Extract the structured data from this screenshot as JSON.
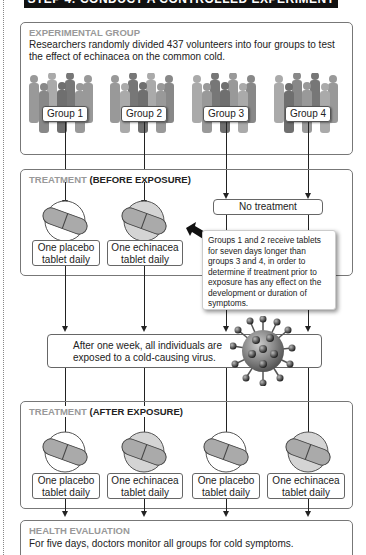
{
  "header": {
    "title": "STEP 4: CONDUCT A CONTROLLED EXPERIMENT"
  },
  "experimental_group": {
    "title": "EXPERIMENTAL GROUP",
    "text_line1": "Researchers randomly divided 437 volunteers into four groups to test",
    "text_line2": "the effect of echinacea on the common cold.",
    "groups": [
      "Group 1",
      "Group 2",
      "Group 3",
      "Group 4"
    ]
  },
  "treatment_before": {
    "title_light": "TREATMENT",
    "title_dark": "(BEFORE EXPOSURE)",
    "tablets": [
      {
        "line1": "One placebo",
        "line2": "tablet daily",
        "type": "placebo"
      },
      {
        "line1": "One echinacea",
        "line2": "tablet daily",
        "type": "echinacea"
      }
    ],
    "no_treatment": "No treatment",
    "note": "Groups 1 and 2 receive tablets for seven days longer than groups 3 and 4, in order to determine if treatment prior to exposure has any effect on the development or duration of symptoms."
  },
  "exposure": {
    "line1": "After one week, all individuals are",
    "line2": "exposed to a cold-causing virus.",
    "icon": "virus-icon"
  },
  "treatment_after": {
    "title_light": "TREATMENT",
    "title_dark": "(AFTER EXPOSURE)",
    "tablets": [
      {
        "line1": "One placebo",
        "line2": "tablet daily",
        "type": "placebo"
      },
      {
        "line1": "One echinacea",
        "line2": "tablet daily",
        "type": "echinacea"
      },
      {
        "line1": "One placebo",
        "line2": "tablet daily",
        "type": "placebo"
      },
      {
        "line1": "One echinacea",
        "line2": "tablet daily",
        "type": "echinacea"
      }
    ]
  },
  "health_evaluation": {
    "title": "HEALTH EVALUATION",
    "text": "For five days, doctors monitor all groups for cold symptoms."
  },
  "colors": {
    "placebo_circle": "#ffffff",
    "echinacea_circle": "#d4d4d4",
    "pill": "#aaaaaa",
    "title_gray": "#999999"
  }
}
